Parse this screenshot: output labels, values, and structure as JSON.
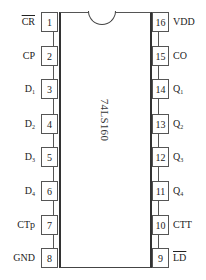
{
  "chip": {
    "part_number": "74LS160",
    "pin_count": 16
  },
  "left_pins": [
    {
      "number": "1",
      "label": "CR",
      "sub": "",
      "active_low": true,
      "top": 12
    },
    {
      "number": "2",
      "label": "CP",
      "sub": "",
      "active_low": false,
      "top": 46
    },
    {
      "number": "3",
      "label": "D",
      "sub": "1",
      "active_low": false,
      "top": 79
    },
    {
      "number": "4",
      "label": "D",
      "sub": "2",
      "active_low": false,
      "top": 114
    },
    {
      "number": "5",
      "label": "D",
      "sub": "3",
      "active_low": false,
      "top": 147
    },
    {
      "number": "6",
      "label": "D",
      "sub": "4",
      "active_low": false,
      "top": 181
    },
    {
      "number": "7",
      "label": "CTp",
      "sub": "",
      "active_low": false,
      "top": 215
    },
    {
      "number": "8",
      "label": "GND",
      "sub": "",
      "active_low": false,
      "top": 248
    }
  ],
  "right_pins": [
    {
      "number": "16",
      "label": "VDD",
      "sub": "",
      "active_low": false,
      "top": 12
    },
    {
      "number": "15",
      "label": "CO",
      "sub": "",
      "active_low": false,
      "top": 46
    },
    {
      "number": "14",
      "label": "Q",
      "sub": "1",
      "active_low": false,
      "top": 79
    },
    {
      "number": "13",
      "label": "Q",
      "sub": "2",
      "active_low": false,
      "top": 114
    },
    {
      "number": "12",
      "label": "Q",
      "sub": "3",
      "active_low": false,
      "top": 147
    },
    {
      "number": "11",
      "label": "Q",
      "sub": "4",
      "active_low": false,
      "top": 181
    },
    {
      "number": "10",
      "label": "CTT",
      "sub": "",
      "active_low": false,
      "top": 215
    },
    {
      "number": "9",
      "label": "LD",
      "sub": "",
      "active_low": true,
      "top": 248
    }
  ],
  "colors": {
    "line": "#444444",
    "text": "#222222",
    "background": "#ffffff"
  }
}
